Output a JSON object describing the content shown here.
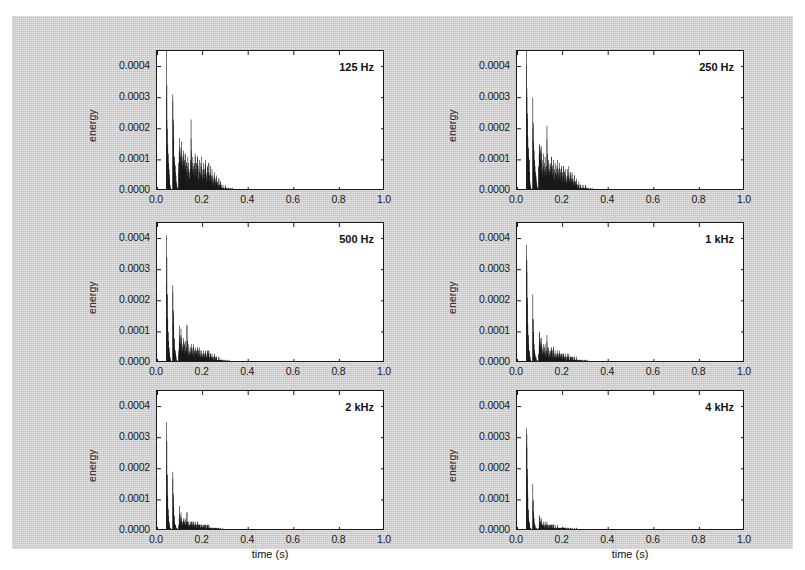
{
  "figure": {
    "background_color": "#cfcfcf",
    "panel_background_color": "#ffffff",
    "bar_color": "#111111",
    "axis_color": "#1a1a1a",
    "xlabel": "time (s)",
    "ylabel": "energy"
  },
  "axis": {
    "xticks": [
      "0.0",
      "0.2",
      "0.4",
      "0.6",
      "0.8",
      "1.0"
    ],
    "xtick_values": [
      0.0,
      0.2,
      0.4,
      0.6,
      0.8,
      1.0
    ],
    "yticks": [
      "0.0000",
      "0.0001",
      "0.0002",
      "0.0003",
      "0.0004"
    ],
    "ytick_values": [
      0.0,
      0.0001,
      0.0002,
      0.0003,
      0.0004
    ],
    "xlim": [
      0.0,
      1.0
    ],
    "ylim": [
      0.0,
      0.00045
    ]
  },
  "panels": [
    {
      "id": "p125",
      "title": "125 Hz"
    },
    {
      "id": "p250",
      "title": "250 Hz"
    },
    {
      "id": "p500",
      "title": "500 Hz"
    },
    {
      "id": "p1k",
      "title": "1 kHz"
    },
    {
      "id": "p2k",
      "title": "2 kHz"
    },
    {
      "id": "p4k",
      "title": "4 kHz"
    }
  ],
  "chart_data": {
    "type": "bar",
    "title": "",
    "subtitle": "",
    "xlabel": "time (s)",
    "ylabel": "energy",
    "xlim": [
      0.0,
      1.0
    ],
    "ylim": [
      0.0,
      0.00045
    ],
    "xticks": [
      0.0,
      0.2,
      0.4,
      0.6,
      0.8,
      1.0
    ],
    "yticks": [
      0.0,
      0.0001,
      0.0002,
      0.0003,
      0.0004
    ],
    "grid": false,
    "legend": "none",
    "layout": {
      "rows": 3,
      "cols": 2,
      "order": "row-major"
    },
    "bin_width": 0.002,
    "x_start": 0.04,
    "note": "Six sub-panels of reflection energy vs arrival time, one per octave band. Values are energy in arbitrary units; x in seconds.",
    "series": [
      {
        "name": "125 Hz",
        "panel": 0,
        "x_start": 0.04,
        "bin_width": 0.002,
        "values": [
          0.00045,
          0.00034,
          0.0002,
          0.00015,
          0.00012,
          9e-05,
          7e-05,
          4e-05,
          2e-05,
          1e-05,
          0.0,
          0.0,
          0.0,
          0.0,
          0.00031,
          0.00023,
          0.00017,
          0.00011,
          9e-05,
          8e-05,
          6e-05,
          5e-05,
          3e-05,
          2e-05,
          1e-05,
          1e-05,
          0.0,
          9e-05,
          0.00013,
          0.00017,
          0.00014,
          0.00011,
          0.00012,
          0.00016,
          0.0001,
          8e-05,
          0.00011,
          0.00013,
          9e-05,
          7e-05,
          0.0001,
          0.00012,
          8e-05,
          6e-05,
          9e-05,
          5e-05,
          8e-05,
          0.00011,
          7e-05,
          9e-05,
          6e-05,
          4e-05,
          7e-05,
          0.0001,
          0.00023,
          0.00013,
          9e-05,
          7e-05,
          0.00011,
          6e-05,
          8e-05,
          5e-05,
          9e-05,
          0.00012,
          7e-05,
          5e-05,
          9e-05,
          6e-05,
          0.00011,
          8e-05,
          4e-05,
          7e-05,
          0.0001,
          6e-05,
          9e-05,
          5e-05,
          8e-05,
          0.00011,
          6e-05,
          4e-05,
          7e-05,
          9e-05,
          5e-05,
          7e-05,
          4e-05,
          8e-05,
          0.0001,
          5e-05,
          3e-05,
          6e-05,
          8e-05,
          4e-05,
          6e-05,
          9e-05,
          5e-05,
          3e-05,
          6e-05,
          8e-05,
          4e-05,
          5e-05,
          7e-05,
          3e-05,
          5e-05,
          2e-05,
          4e-05,
          6e-05,
          3e-05,
          4e-05,
          2e-05,
          3e-05,
          5e-05,
          2e-05,
          3e-05,
          1e-05,
          2e-05,
          4e-05,
          2e-05,
          1e-05,
          2e-05,
          3e-05,
          1e-05,
          2e-05,
          1e-05,
          1e-05,
          2e-05,
          1e-05,
          1e-05,
          0.0,
          1e-05,
          2e-05,
          1e-05,
          0.0,
          1e-05,
          1e-05,
          0.0,
          0.0,
          1e-05,
          1e-05,
          0.0,
          0.0,
          1e-05,
          0.0,
          0.0,
          0.0,
          1e-05,
          0.0,
          0.0,
          0.0,
          0.0,
          0.0,
          0.0,
          0.0,
          0.0,
          0.0,
          0.0,
          0.0,
          0.0,
          0.0,
          0.0
        ],
        "tail_end": 0.52
      },
      {
        "name": "250 Hz",
        "panel": 1,
        "x_start": 0.04,
        "bin_width": 0.002,
        "values": [
          0.00045,
          0.00033,
          0.00025,
          0.00018,
          0.00014,
          0.00011,
          0.0001,
          6e-05,
          3e-05,
          2e-05,
          1e-05,
          0.0,
          0.0,
          0.0,
          0.0003,
          0.00022,
          0.00016,
          0.00013,
          0.0001,
          8e-05,
          6e-05,
          5e-05,
          3e-05,
          2e-05,
          1e-05,
          1e-05,
          0.0,
          8e-05,
          0.00012,
          0.00015,
          0.00013,
          0.0001,
          0.00014,
          0.00012,
          9e-05,
          7e-05,
          0.0001,
          0.00012,
          8e-05,
          6e-05,
          9e-05,
          0.00011,
          7e-05,
          5e-05,
          8e-05,
          0.00021,
          0.00012,
          8e-05,
          6e-05,
          0.0001,
          5e-05,
          7e-05,
          9e-05,
          6e-05,
          8e-05,
          0.00011,
          7e-05,
          5e-05,
          8e-05,
          0.0001,
          6e-05,
          4e-05,
          7e-05,
          9e-05,
          6e-05,
          8e-05,
          5e-05,
          7e-05,
          0.0001,
          6e-05,
          4e-05,
          7e-05,
          9e-05,
          5e-05,
          7e-05,
          4e-05,
          6e-05,
          8e-05,
          5e-05,
          3e-05,
          6e-05,
          8e-05,
          4e-05,
          6e-05,
          3e-05,
          5e-05,
          7e-05,
          4e-05,
          3e-05,
          5e-05,
          7e-05,
          4e-05,
          5e-05,
          8e-05,
          4e-05,
          3e-05,
          5e-05,
          6e-05,
          3e-05,
          4e-05,
          6e-05,
          3e-05,
          4e-05,
          2e-05,
          3e-05,
          5e-05,
          2e-05,
          3e-05,
          2e-05,
          3e-05,
          4e-05,
          2e-05,
          2e-05,
          1e-05,
          2e-05,
          3e-05,
          1e-05,
          1e-05,
          2e-05,
          2e-05,
          1e-05,
          1e-05,
          1e-05,
          1e-05,
          2e-05,
          1e-05,
          1e-05,
          0.0,
          1e-05,
          2e-05,
          1e-05,
          0.0,
          1e-05,
          1e-05,
          0.0,
          0.0,
          1e-05,
          1e-05,
          0.0,
          0.0,
          1e-05,
          0.0,
          0.0,
          0.0,
          1e-05,
          0.0,
          0.0,
          0.0,
          0.0,
          0.0,
          0.0,
          0.0,
          0.0,
          0.0,
          0.0,
          0.0,
          0.0,
          0.0,
          0.0
        ],
        "tail_end": 0.51
      },
      {
        "name": "500 Hz",
        "panel": 2,
        "x_start": 0.04,
        "bin_width": 0.002,
        "values": [
          0.00041,
          0.00034,
          0.00022,
          0.00014,
          0.0001,
          7e-05,
          5e-05,
          3e-05,
          2e-05,
          1e-05,
          0.0,
          0.0,
          0.0,
          0.0,
          0.00025,
          0.00017,
          0.00013,
          8e-05,
          5e-05,
          4e-05,
          3e-05,
          2e-05,
          1e-05,
          1e-05,
          0.0,
          0.0,
          0.0,
          4e-05,
          7e-05,
          0.00012,
          9e-05,
          6e-05,
          0.00011,
          8e-05,
          5e-05,
          4e-05,
          6e-05,
          8e-05,
          5e-05,
          3e-05,
          6e-05,
          7e-05,
          4e-05,
          3e-05,
          5e-05,
          0.00012,
          7e-05,
          4e-05,
          3e-05,
          6e-05,
          3e-05,
          4e-05,
          5e-05,
          3e-05,
          5e-05,
          6e-05,
          4e-05,
          3e-05,
          5e-05,
          6e-05,
          3e-05,
          2e-05,
          4e-05,
          5e-05,
          3e-05,
          4e-05,
          3e-05,
          4e-05,
          5e-05,
          3e-05,
          2e-05,
          4e-05,
          5e-05,
          3e-05,
          4e-05,
          2e-05,
          3e-05,
          4e-05,
          3e-05,
          2e-05,
          3e-05,
          4e-05,
          2e-05,
          3e-05,
          2e-05,
          3e-05,
          4e-05,
          2e-05,
          2e-05,
          3e-05,
          4e-05,
          2e-05,
          3e-05,
          4e-05,
          2e-05,
          1e-05,
          3e-05,
          3e-05,
          2e-05,
          2e-05,
          3e-05,
          2e-05,
          2e-05,
          1e-05,
          2e-05,
          3e-05,
          1e-05,
          2e-05,
          1e-05,
          2e-05,
          2e-05,
          1e-05,
          1e-05,
          1e-05,
          1e-05,
          2e-05,
          1e-05,
          1e-05,
          1e-05,
          1e-05,
          1e-05,
          1e-05,
          0.0,
          1e-05,
          1e-05,
          1e-05,
          0.0,
          0.0,
          1e-05,
          1e-05,
          0.0,
          0.0,
          0.0,
          1e-05,
          0.0,
          0.0,
          0.0,
          1e-05,
          0.0,
          0.0,
          0.0,
          0.0,
          0.0,
          0.0,
          0.0,
          0.0,
          0.0,
          0.0,
          0.0,
          0.0,
          0.0,
          0.0,
          0.0,
          0.0,
          0.0,
          0.0,
          0.0,
          0.0,
          0.0
        ],
        "tail_end": 0.47
      },
      {
        "name": "1 kHz",
        "panel": 3,
        "x_start": 0.04,
        "bin_width": 0.002,
        "values": [
          0.00038,
          0.00033,
          0.00021,
          0.00013,
          9e-05,
          6e-05,
          4e-05,
          3e-05,
          2e-05,
          1e-05,
          0.0,
          0.0,
          0.0,
          0.0,
          0.00022,
          0.00014,
          0.0001,
          6e-05,
          4e-05,
          3e-05,
          2e-05,
          2e-05,
          1e-05,
          1e-05,
          0.0,
          0.0,
          0.0,
          3e-05,
          6e-05,
          0.0001,
          7e-05,
          5e-05,
          8e-05,
          6e-05,
          4e-05,
          3e-05,
          5e-05,
          6e-05,
          4e-05,
          3e-05,
          5e-05,
          6e-05,
          3e-05,
          2e-05,
          4e-05,
          9e-05,
          5e-05,
          3e-05,
          2e-05,
          5e-05,
          2e-05,
          3e-05,
          4e-05,
          2e-05,
          4e-05,
          5e-05,
          3e-05,
          2e-05,
          4e-05,
          5e-05,
          2e-05,
          2e-05,
          3e-05,
          4e-05,
          2e-05,
          3e-05,
          2e-05,
          3e-05,
          4e-05,
          2e-05,
          2e-05,
          3e-05,
          4e-05,
          2e-05,
          3e-05,
          2e-05,
          2e-05,
          3e-05,
          2e-05,
          1e-05,
          3e-05,
          3e-05,
          2e-05,
          2e-05,
          1e-05,
          2e-05,
          3e-05,
          2e-05,
          1e-05,
          2e-05,
          3e-05,
          2e-05,
          2e-05,
          3e-05,
          1e-05,
          1e-05,
          2e-05,
          2e-05,
          1e-05,
          2e-05,
          2e-05,
          1e-05,
          2e-05,
          1e-05,
          1e-05,
          2e-05,
          1e-05,
          1e-05,
          1e-05,
          1e-05,
          2e-05,
          1e-05,
          1e-05,
          1e-05,
          1e-05,
          1e-05,
          1e-05,
          1e-05,
          1e-05,
          1e-05,
          0.0,
          1e-05,
          0.0,
          1e-05,
          1e-05,
          0.0,
          0.0,
          0.0,
          1e-05,
          1e-05,
          0.0,
          0.0,
          0.0,
          1e-05,
          0.0,
          0.0,
          0.0,
          0.0,
          0.0,
          0.0,
          0.0,
          0.0,
          0.0,
          0.0,
          0.0,
          0.0,
          0.0,
          0.0,
          0.0,
          0.0,
          0.0,
          0.0,
          0.0,
          0.0,
          0.0,
          0.0,
          0.0,
          0.0,
          0.0
        ],
        "tail_end": 0.45
      },
      {
        "name": "2 kHz",
        "panel": 4,
        "x_start": 0.04,
        "bin_width": 0.002,
        "values": [
          0.00035,
          0.00029,
          0.00018,
          0.00011,
          7e-05,
          5e-05,
          3e-05,
          2e-05,
          1e-05,
          1e-05,
          0.0,
          0.0,
          0.0,
          0.0,
          0.00019,
          0.00012,
          8e-05,
          5e-05,
          3e-05,
          2e-05,
          2e-05,
          1e-05,
          1e-05,
          1e-05,
          0.0,
          0.0,
          0.0,
          2e-05,
          4e-05,
          8e-05,
          5e-05,
          3e-05,
          6e-05,
          4e-05,
          3e-05,
          2e-05,
          3e-05,
          4e-05,
          3e-05,
          2e-05,
          3e-05,
          4e-05,
          2e-05,
          2e-05,
          3e-05,
          6e-05,
          3e-05,
          2e-05,
          2e-05,
          3e-05,
          2e-05,
          2e-05,
          3e-05,
          2e-05,
          3e-05,
          3e-05,
          2e-05,
          2e-05,
          3e-05,
          3e-05,
          2e-05,
          1e-05,
          2e-05,
          3e-05,
          2e-05,
          2e-05,
          1e-05,
          2e-05,
          3e-05,
          2e-05,
          1e-05,
          2e-05,
          2e-05,
          2e-05,
          2e-05,
          1e-05,
          2e-05,
          2e-05,
          1e-05,
          1e-05,
          2e-05,
          2e-05,
          1e-05,
          2e-05,
          1e-05,
          2e-05,
          2e-05,
          1e-05,
          1e-05,
          2e-05,
          2e-05,
          1e-05,
          1e-05,
          2e-05,
          1e-05,
          1e-05,
          1e-05,
          1e-05,
          1e-05,
          1e-05,
          1e-05,
          1e-05,
          1e-05,
          1e-05,
          1e-05,
          1e-05,
          1e-05,
          1e-05,
          1e-05,
          1e-05,
          1e-05,
          0.0,
          1e-05,
          0.0,
          1e-05,
          1e-05,
          0.0,
          0.0,
          0.0,
          1e-05,
          0.0,
          0.0,
          0.0,
          0.0,
          1e-05,
          0.0,
          0.0,
          0.0,
          0.0,
          0.0,
          0.0,
          0.0,
          0.0,
          0.0,
          0.0,
          0.0,
          0.0,
          0.0,
          0.0,
          0.0,
          0.0,
          0.0,
          0.0,
          0.0,
          0.0,
          0.0,
          0.0,
          0.0,
          0.0,
          0.0,
          0.0,
          0.0,
          0.0,
          0.0,
          0.0,
          0.0,
          0.0,
          0.0,
          0.0
        ],
        "tail_end": 0.44
      },
      {
        "name": "4 kHz",
        "panel": 5,
        "x_start": 0.04,
        "bin_width": 0.002,
        "values": [
          0.00033,
          0.00031,
          0.0002,
          0.00012,
          7e-05,
          4e-05,
          3e-05,
          2e-05,
          1e-05,
          1e-05,
          0.0,
          0.0,
          0.0,
          0.0,
          0.00015,
          0.0001,
          6e-05,
          4e-05,
          2e-05,
          2e-05,
          1e-05,
          1e-05,
          1e-05,
          0.0,
          0.0,
          0.0,
          0.0,
          1e-05,
          3e-05,
          5e-05,
          3e-05,
          2e-05,
          4e-05,
          3e-05,
          2e-05,
          2e-05,
          2e-05,
          3e-05,
          2e-05,
          1e-05,
          2e-05,
          3e-05,
          2e-05,
          1e-05,
          2e-05,
          3e-05,
          2e-05,
          1e-05,
          1e-05,
          2e-05,
          1e-05,
          2e-05,
          2e-05,
          1e-05,
          2e-05,
          2e-05,
          1e-05,
          1e-05,
          2e-05,
          2e-05,
          1e-05,
          1e-05,
          1e-05,
          2e-05,
          1e-05,
          1e-05,
          1e-05,
          1e-05,
          2e-05,
          1e-05,
          1e-05,
          1e-05,
          1e-05,
          1e-05,
          1e-05,
          1e-05,
          1e-05,
          1e-05,
          1e-05,
          1e-05,
          1e-05,
          1e-05,
          1e-05,
          1e-05,
          1e-05,
          1e-05,
          1e-05,
          1e-05,
          0.0,
          1e-05,
          1e-05,
          0.0,
          1e-05,
          1e-05,
          0.0,
          0.0,
          1e-05,
          1e-05,
          0.0,
          0.0,
          1e-05,
          0.0,
          0.0,
          0.0,
          0.0,
          1e-05,
          0.0,
          0.0,
          0.0,
          0.0,
          1e-05,
          0.0,
          0.0,
          0.0,
          0.0,
          0.0,
          0.0,
          0.0,
          0.0,
          0.0,
          0.0,
          0.0,
          0.0,
          0.0,
          0.0,
          0.0,
          0.0,
          0.0,
          0.0,
          0.0,
          0.0,
          0.0,
          0.0,
          0.0,
          0.0,
          0.0,
          0.0,
          0.0,
          0.0,
          0.0,
          0.0,
          0.0,
          0.0,
          0.0,
          0.0,
          0.0,
          0.0,
          0.0,
          0.0,
          0.0,
          0.0,
          0.0,
          0.0,
          0.0,
          0.0,
          0.0,
          0.0,
          0.0,
          0.0
        ],
        "tail_end": 0.38
      }
    ]
  }
}
